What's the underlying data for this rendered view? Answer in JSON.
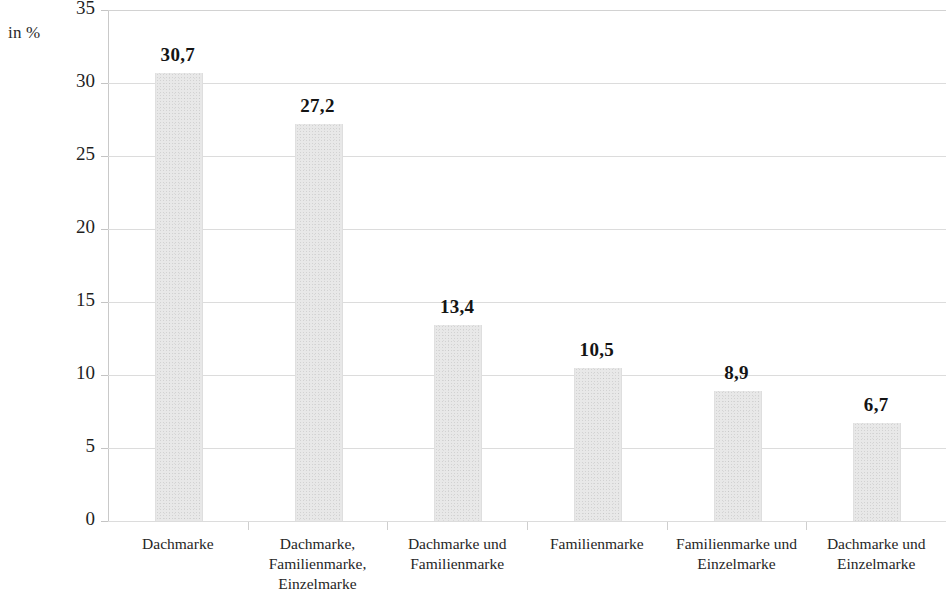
{
  "axis_unit_label": "in %",
  "chart_data": {
    "type": "bar",
    "title": "",
    "xlabel": "",
    "ylabel": "in %",
    "ylim": [
      0,
      35
    ],
    "y_ticks": [
      "0",
      "5",
      "10",
      "15",
      "20",
      "25",
      "30",
      "35"
    ],
    "grid": true,
    "legend": "none",
    "categories": [
      "Dachmarke",
      "Dachmarke,\nFamilienmarke,\nEinzelmarke",
      "Dachmarke und\nFamilienmarke",
      "Familienmarke",
      "Familienmarke und\nEinzelmarke",
      "Dachmarke und\nEinzelmarke"
    ],
    "values": [
      30.7,
      27.2,
      13.4,
      10.5,
      8.9,
      6.7
    ],
    "value_labels": [
      "30,7",
      "27,2",
      "13,4",
      "10,5",
      "8,9",
      "6,7"
    ],
    "bar_color": "#e8e8e8",
    "gridline_color": "#dcdcdc",
    "text_color": "#1a1a1a"
  }
}
